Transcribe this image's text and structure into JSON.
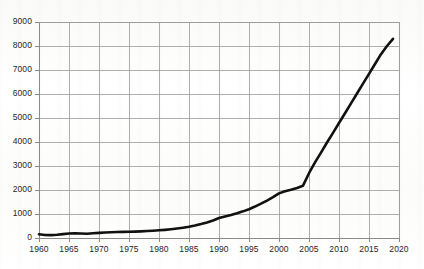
{
  "chart_data": {
    "type": "line",
    "title": "",
    "subtitle": "",
    "xlabel": "",
    "ylabel": "",
    "xlim": [
      1960,
      2020
    ],
    "ylim": [
      0,
      9000
    ],
    "grid": true,
    "legend": null,
    "x_tick_labels": [
      "1960",
      "1965",
      "1970",
      "1975",
      "1980",
      "1985",
      "1990",
      "1995",
      "2000",
      "2005",
      "2010",
      "2015",
      "2020"
    ],
    "y_tick_labels": [
      "0",
      "1000",
      "2000",
      "3000",
      "4000",
      "5000",
      "6000",
      "7000",
      "8000",
      "9000"
    ],
    "x_ticks": [
      1960,
      1965,
      1970,
      1975,
      1980,
      1985,
      1990,
      1995,
      2000,
      2005,
      2010,
      2015,
      2020
    ],
    "y_ticks": [
      0,
      1000,
      2000,
      3000,
      4000,
      5000,
      6000,
      7000,
      8000,
      9000
    ],
    "line_color": "#111111",
    "line_width": 2.6,
    "grid_color": "#9a9a9a",
    "axis_color": "#8a8a8a",
    "series": [
      {
        "name": "series-1",
        "x": [
          1960,
          1961,
          1962,
          1963,
          1964,
          1965,
          1966,
          1967,
          1968,
          1969,
          1970,
          1971,
          1972,
          1973,
          1974,
          1975,
          1976,
          1977,
          1978,
          1979,
          1980,
          1981,
          1982,
          1983,
          1984,
          1985,
          1986,
          1987,
          1988,
          1989,
          1990,
          1991,
          1992,
          1993,
          1994,
          1995,
          1996,
          1997,
          1998,
          1999,
          2000,
          2001,
          2002,
          2003,
          2004,
          2005,
          2006,
          2007,
          2008,
          2009,
          2010,
          2011,
          2012,
          2013,
          2014,
          2015,
          2016,
          2017,
          2018,
          2019
        ],
        "y": [
          155,
          125,
          120,
          135,
          160,
          185,
          195,
          190,
          180,
          195,
          215,
          230,
          240,
          250,
          255,
          260,
          265,
          275,
          290,
          305,
          320,
          340,
          365,
          395,
          430,
          470,
          520,
          580,
          650,
          730,
          830,
          900,
          960,
          1030,
          1110,
          1200,
          1310,
          1430,
          1560,
          1700,
          1860,
          1950,
          2010,
          2080,
          2180,
          2700,
          3150,
          3560,
          3980,
          4380,
          4790,
          5200,
          5610,
          6020,
          6430,
          6840,
          7250,
          7660,
          8000,
          8300
        ]
      }
    ]
  },
  "plot_geometry": {
    "left": 39,
    "right": 399,
    "top": 22,
    "bottom": 238
  }
}
